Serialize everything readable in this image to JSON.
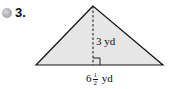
{
  "problem": {
    "number": "3.",
    "icon": "cd-disc-icon"
  },
  "figure": {
    "shape": "triangle",
    "fill_color": "#e6e6e6",
    "stroke_color": "#111111",
    "height_label": "3 yd",
    "base_label": {
      "whole": "6",
      "numerator": "1",
      "denominator": "2",
      "unit": "yd"
    },
    "right_angle_marker": true,
    "altitude_style": "dashed"
  }
}
